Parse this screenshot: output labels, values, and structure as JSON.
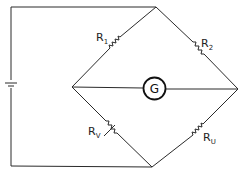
{
  "diagram": {
    "type": "Wheatstone bridge circuit",
    "components": {
      "r1": {
        "label": "R",
        "subscript": "1"
      },
      "r2": {
        "label": "R",
        "subscript": "2"
      },
      "rv": {
        "label": "R",
        "subscript": "V"
      },
      "ru": {
        "label": "R",
        "subscript": "U"
      },
      "galvanometer": {
        "label": "G"
      },
      "battery": {
        "label": ""
      }
    },
    "colors": {
      "line": "#2a2a2a",
      "background": "#ffffff"
    }
  }
}
